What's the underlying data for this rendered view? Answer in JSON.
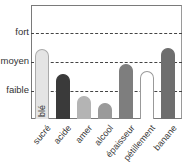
{
  "chart_data": {
    "type": "bar",
    "title": "",
    "xlabel": "",
    "ylabel": "",
    "categories": [
      "sucré",
      "acide",
      "amer",
      "alcool",
      "épaisseur",
      "pétillement",
      "banane"
    ],
    "values": [
      2.4,
      1.55,
      0.8,
      0.55,
      1.9,
      1.65,
      2.45
    ],
    "y_tick_labels": [
      "faible",
      "moyen",
      "fort"
    ],
    "y_tick_values": [
      1,
      2,
      3
    ],
    "ylim": [
      0,
      3.9
    ],
    "grid": "horizontal dashed at faible, moyen, fort",
    "legend": null,
    "annotations": [
      {
        "text": "blé",
        "bar": "sucré",
        "orientation": "vertical"
      }
    ],
    "bar_colors": [
      "#e4e4e4",
      "#3a3a3a",
      "#b4b4b4",
      "#9a9a9a",
      "#7e7e7e",
      "#ffffff",
      "#6e6e6e"
    ],
    "bar_outlines": [
      "#aaaaaa",
      "#3a3a3a",
      "#b4b4b4",
      "#9a9a9a",
      "#7e7e7e",
      "#999999",
      "#6e6e6e"
    ]
  }
}
